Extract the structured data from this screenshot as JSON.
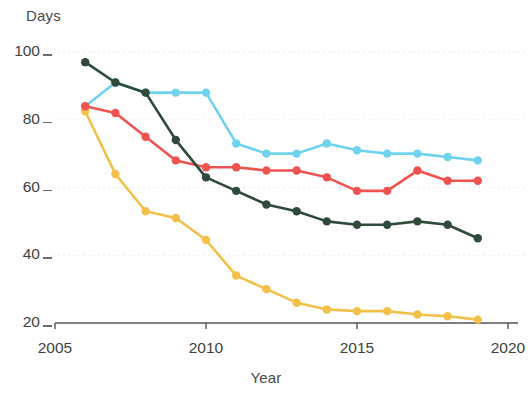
{
  "chart_data": {
    "type": "line",
    "title": "",
    "subtitle": "",
    "xlabel": "Year",
    "ylabel": "Days",
    "x": [
      2006,
      2007,
      2008,
      2009,
      2010,
      2011,
      2012,
      2013,
      2014,
      2015,
      2016,
      2017,
      2018,
      2019
    ],
    "xlim": [
      2005,
      2020
    ],
    "ylim": [
      20,
      100
    ],
    "x_ticks": [
      2005,
      2010,
      2015,
      2020
    ],
    "x_tick_labels": [
      "2005",
      "2010",
      "2015",
      "2020"
    ],
    "y_ticks": [
      20,
      40,
      60,
      80,
      100
    ],
    "y_tick_labels": [
      "20",
      "40",
      "60",
      "80",
      "100"
    ],
    "grid": "horizontal-dotted",
    "legend": "none",
    "series": [
      {
        "name": "dark-green-series",
        "color": "#2f4a3a",
        "values": [
          97,
          91,
          88,
          74,
          63,
          59,
          55,
          53,
          50,
          49,
          49,
          50,
          49,
          45
        ]
      },
      {
        "name": "light-blue-series",
        "color": "#6fd2ee",
        "values": [
          84,
          91,
          88,
          88,
          88,
          73,
          70,
          70,
          73,
          71,
          70,
          70,
          69,
          68
        ]
      },
      {
        "name": "red-series",
        "color": "#ef5350",
        "values": [
          84,
          82,
          75,
          68,
          66,
          66,
          65,
          65,
          63,
          59,
          59,
          65,
          62,
          62
        ]
      },
      {
        "name": "yellow-series",
        "color": "#f3c14a",
        "values": [
          82.5,
          64,
          53,
          51,
          44.5,
          34,
          30,
          26,
          24,
          23.5,
          23.5,
          22.5,
          22,
          21
        ]
      }
    ]
  },
  "axes": {
    "y_title": "Days",
    "x_title": "Year"
  },
  "colors": {
    "axis": "#55555a",
    "grid": "#ededef",
    "text": "#3f3f3f",
    "background": "#ffffff"
  }
}
